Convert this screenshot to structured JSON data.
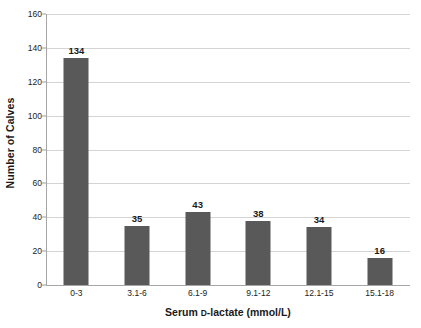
{
  "chart_data": {
    "type": "bar",
    "title": "",
    "xlabel": "Serum D-lactate (mmol/L)",
    "xlabel_prefix": "Serum ",
    "xlabel_smallcap": "D",
    "xlabel_suffix": "-lactate (mmol/L)",
    "ylabel": "Number of Calves",
    "categories": [
      "0-3",
      "3.1-6",
      "6.1-9",
      "9.1-12",
      "12.1-15",
      "15.1-18"
    ],
    "values": [
      134,
      35,
      43,
      38,
      34,
      16
    ],
    "value_labels": [
      "134",
      "35",
      "43",
      "38",
      "34",
      "16"
    ],
    "ylim": [
      0,
      160
    ],
    "ytick_values": [
      0,
      20,
      40,
      60,
      80,
      100,
      120,
      140,
      160
    ],
    "ytick_labels": [
      "0",
      "20",
      "40",
      "60",
      "80",
      "100",
      "120",
      "140",
      "160"
    ],
    "grid": "horizontal",
    "legend": "none",
    "bar_color": "#595959",
    "gridline_color": "#d4d4d4",
    "axis_color": "#a6a6a6",
    "text_color": "#1a1a1a",
    "background_color": "#ffffff"
  }
}
